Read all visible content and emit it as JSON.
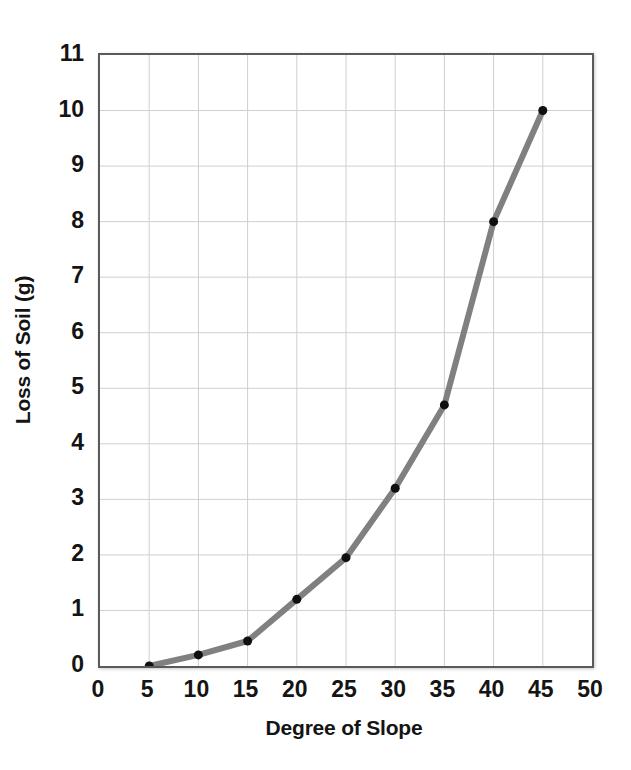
{
  "chart_data": {
    "type": "line",
    "title": "",
    "subtitle": "",
    "xlabel": "Degree of Slope",
    "ylabel": "Loss of Soil (g)",
    "xlim": [
      0,
      50
    ],
    "ylim": [
      0,
      11
    ],
    "xticks": [
      0,
      5,
      10,
      15,
      20,
      25,
      30,
      35,
      40,
      45,
      50
    ],
    "yticks": [
      0,
      1,
      2,
      3,
      4,
      5,
      6,
      7,
      8,
      9,
      10,
      11
    ],
    "xtick_labels": [
      "0",
      "5",
      "10",
      "15",
      "20",
      "25",
      "30",
      "35",
      "40",
      "45",
      "50"
    ],
    "ytick_labels": [
      "0",
      "1",
      "2",
      "3",
      "4",
      "5",
      "6",
      "7",
      "8",
      "9",
      "10",
      "11"
    ],
    "grid": true,
    "grid_color": "#cfcfcf",
    "legend": false,
    "legend_position": "none",
    "annotations": [],
    "series": [
      {
        "name": "Loss of Soil",
        "line_color": "#808080",
        "line_width": 6,
        "marker": "circle",
        "marker_color": "#101010",
        "marker_size": 9,
        "x": [
          5,
          10,
          15,
          20,
          25,
          30,
          35,
          40,
          45
        ],
        "values": [
          0,
          0.2,
          0.45,
          1.2,
          1.95,
          3.2,
          4.7,
          8,
          10
        ]
      }
    ]
  },
  "axes": {
    "x_title": "Degree of Slope",
    "y_title": "Loss of Soil (g)"
  },
  "style": {
    "background": "#ffffff",
    "plot_border_color": "#5a5a5a",
    "grid_color": "#cfcfcf",
    "line_color": "#808080",
    "marker_color": "#101010",
    "text_color": "#141414"
  }
}
